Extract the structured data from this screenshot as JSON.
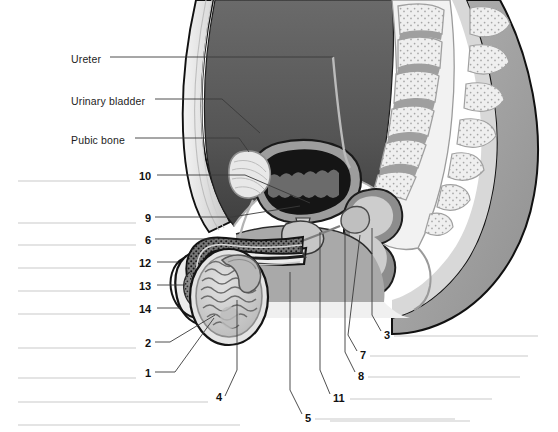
{
  "figure": {
    "view": "sagittal-section"
  },
  "named_labels": [
    {
      "id": "ureter",
      "text": "Ureter",
      "text_x": 71,
      "text_y": 61,
      "line": [
        [
          110,
          57
        ],
        [
          333,
          57
        ]
      ]
    },
    {
      "id": "urinary-bladder",
      "text": "Urinary bladder",
      "text_x": 71,
      "text_y": 103,
      "line": [
        [
          155,
          99
        ],
        [
          222,
          99
        ],
        [
          260,
          133
        ]
      ]
    },
    {
      "id": "pubic-bone",
      "text": "Pubic bone",
      "text_x": 71,
      "text_y": 142,
      "line": [
        [
          135,
          138
        ],
        [
          239,
          138
        ],
        [
          249,
          152
        ]
      ]
    }
  ],
  "numbered_callouts": [
    {
      "number": "10",
      "num_x": 139,
      "num_y": 178,
      "answer_line": [
        [
          18,
          181
        ],
        [
          130,
          181
        ]
      ],
      "leader": [
        [
          157,
          175
        ],
        [
          245,
          175
        ],
        [
          310,
          203
        ]
      ]
    },
    {
      "number": "9",
      "num_x": 145,
      "num_y": 220,
      "answer_line": [
        [
          18,
          223
        ],
        [
          136,
          223
        ]
      ],
      "leader": [
        [
          155,
          217
        ],
        [
          232,
          217
        ],
        [
          300,
          206
        ]
      ]
    },
    {
      "number": "6",
      "num_x": 145,
      "num_y": 242,
      "answer_line": [
        [
          18,
          245
        ],
        [
          136,
          245
        ]
      ],
      "leader": [
        [
          155,
          239
        ],
        [
          215,
          239
        ]
      ]
    },
    {
      "number": "12",
      "num_x": 139,
      "num_y": 265,
      "answer_line": [
        [
          18,
          268
        ],
        [
          130,
          268
        ]
      ],
      "leader": [
        [
          157,
          262
        ],
        [
          178,
          262
        ]
      ]
    },
    {
      "number": "13",
      "num_x": 139,
      "num_y": 288,
      "answer_line": [
        [
          18,
          291
        ],
        [
          130,
          291
        ]
      ],
      "leader": [
        [
          157,
          285
        ],
        [
          185,
          285
        ]
      ]
    },
    {
      "number": "14",
      "num_x": 139,
      "num_y": 311,
      "answer_line": [
        [
          18,
          314
        ],
        [
          130,
          314
        ]
      ],
      "leader": [
        [
          157,
          308
        ],
        [
          180,
          308
        ]
      ]
    },
    {
      "number": "2",
      "num_x": 145,
      "num_y": 345,
      "answer_line": [
        [
          18,
          348
        ],
        [
          136,
          348
        ]
      ],
      "leader": [
        [
          155,
          342
        ],
        [
          170,
          342
        ],
        [
          215,
          315
        ]
      ]
    },
    {
      "number": "1",
      "num_x": 145,
      "num_y": 375,
      "answer_line": [
        [
          18,
          378
        ],
        [
          136,
          378
        ]
      ],
      "leader": [
        [
          155,
          372
        ],
        [
          175,
          372
        ],
        [
          214,
          318
        ]
      ]
    },
    {
      "number": "4",
      "num_x": 216,
      "num_y": 399,
      "answer_line": [
        [
          18,
          402
        ],
        [
          208,
          402
        ]
      ],
      "leader": [
        [
          225,
          396
        ],
        [
          237,
          370
        ],
        [
          237,
          300
        ]
      ]
    },
    {
      "number": "5",
      "num_x": 305,
      "num_y": 420,
      "answer_line": [
        [
          315,
          419
        ],
        [
          455,
          419
        ]
      ],
      "leader": [
        [
          302,
          414
        ],
        [
          290,
          390
        ],
        [
          290,
          272
        ]
      ]
    },
    {
      "number": "11",
      "num_x": 333,
      "num_y": 400,
      "answer_line": [
        [
          350,
          399
        ],
        [
          492,
          399
        ]
      ],
      "leader": [
        [
          330,
          394
        ],
        [
          320,
          370
        ],
        [
          320,
          232
        ]
      ]
    },
    {
      "number": "8",
      "num_x": 358,
      "num_y": 378,
      "answer_line": [
        [
          368,
          377
        ],
        [
          520,
          377
        ]
      ],
      "leader": [
        [
          355,
          372
        ],
        [
          345,
          352
        ],
        [
          345,
          232
        ]
      ]
    },
    {
      "number": "7",
      "num_x": 360,
      "num_y": 357,
      "answer_line": [
        [
          370,
          356
        ],
        [
          528,
          356
        ]
      ],
      "leader": [
        [
          357,
          351
        ],
        [
          348,
          335
        ],
        [
          360,
          235
        ]
      ]
    },
    {
      "number": "3",
      "num_x": 384,
      "num_y": 337,
      "answer_line": [
        [
          394,
          336
        ],
        [
          538,
          336
        ]
      ],
      "leader": [
        [
          381,
          331
        ],
        [
          372,
          315
        ],
        [
          372,
          228
        ]
      ]
    }
  ],
  "extra_answer_lines": [
    {
      "id": "blank-left-bottom",
      "line": [
        [
          18,
          425
        ],
        [
          240,
          425
        ]
      ]
    },
    {
      "id": "blank-right-bottom",
      "line": [
        [
          330,
          421
        ],
        [
          470,
          421
        ]
      ]
    }
  ],
  "colors": {
    "outline": "#111111",
    "answer_line": "#c9c9c9",
    "leader_line": "#3a3a3a",
    "label_text": "#1d1d1d",
    "abdominal_cavity": "#5d5d5d",
    "abdominal_cavity_dark": "#4a4a4a",
    "body_wall": "#d6d6d6",
    "body_wall_light": "#ebebeb",
    "bone_fill": "#ededed",
    "bone_stipple": "#a8a8a8",
    "bone_edge": "#9a9a9a",
    "bladder_lumen": "#1a1a1a",
    "bladder_wall": "#8f8f8f",
    "rectum_fill": "#8a8a8a",
    "rectum_lumen": "#e9e9e9",
    "erectile_tissue": "#6f6f6f",
    "erectile_stipple": "#1c1c1c",
    "testis_fill": "#cfcfcf",
    "tubule_line": "#6a6a6a",
    "epididymis": "#b5b5b5",
    "buttock": "#9c9c9c",
    "perineum": "#a6a6a6",
    "prostate": "#c2c2c2"
  }
}
